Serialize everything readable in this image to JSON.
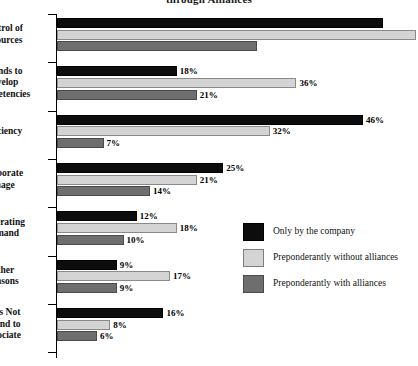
{
  "chart": {
    "title": "through Alliances",
    "title_clipped": true
  },
  "legend": {
    "position": "middle-right",
    "items": [
      {
        "label": "Only by the company",
        "color": "#0d0d0d"
      },
      {
        "label": "Preponderantly without alliances",
        "color": "#d4d4d4"
      },
      {
        "label": "Preponderantly with alliances",
        "color": "#6e6e6e"
      }
    ]
  },
  "chart_data": {
    "type": "bar",
    "orientation": "horizontal",
    "title": "through Alliances",
    "xlabel": "",
    "ylabel": "",
    "xlim": [
      0,
      56
    ],
    "grid": false,
    "value_suffix": "%",
    "categories": [
      "Control of Resources",
      "Intends to Develop Competencies",
      "Efficiency",
      "Corporate Image",
      "Generating Demand",
      "Other Reasons",
      "Does Not Intend to Associate"
    ],
    "category_lines": [
      [
        "Control of",
        "Resources"
      ],
      [
        "Intends to",
        "Develop",
        "Competencies"
      ],
      [
        "Efficiency"
      ],
      [
        "Corporate",
        "Image"
      ],
      [
        "Generating",
        "Demand"
      ],
      [
        "Other",
        "Reasons"
      ],
      [
        "Does Not",
        "Intend to",
        "Associate"
      ]
    ],
    "series": [
      {
        "name": "Only by the company",
        "color": "#0d0d0d",
        "values": [
          49,
          18,
          46,
          25,
          12,
          9,
          16
        ],
        "labels": [
          "",
          "18%",
          "46%",
          "25%",
          "12%",
          "9%",
          "16%"
        ]
      },
      {
        "name": "Preponderantly without alliances",
        "color": "#d4d4d4",
        "values": [
          54,
          36,
          32,
          21,
          18,
          17,
          8
        ],
        "labels": [
          "",
          "36%",
          "32%",
          "21%",
          "18%",
          "17%",
          "8%"
        ]
      },
      {
        "name": "Preponderantly with alliances",
        "color": "#6e6e6e",
        "values": [
          30,
          21,
          7,
          14,
          10,
          9,
          6
        ],
        "labels": [
          "",
          "21%",
          "7%",
          "14%",
          "10%",
          "9%",
          "6%"
        ]
      }
    ]
  }
}
